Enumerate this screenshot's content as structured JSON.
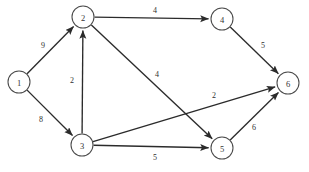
{
  "figure": {
    "type": "directed-weighted-graph",
    "background_color": "#ffffff",
    "node_stroke_color": "#4a4a4a",
    "edge_color": "#2b2b2b",
    "label_color": "#343434"
  },
  "nodes": [
    {
      "id": "1",
      "label": "1",
      "x": 19,
      "y": 82,
      "r": 11
    },
    {
      "id": "2",
      "label": "2",
      "x": 83,
      "y": 17,
      "r": 11
    },
    {
      "id": "3",
      "label": "3",
      "x": 82,
      "y": 145,
      "r": 11
    },
    {
      "id": "4",
      "label": "4",
      "x": 222,
      "y": 19,
      "r": 11
    },
    {
      "id": "5",
      "label": "5",
      "x": 222,
      "y": 148,
      "r": 11
    },
    {
      "id": "6",
      "label": "6",
      "x": 288,
      "y": 83,
      "r": 11
    }
  ],
  "edges": [
    {
      "from": "1",
      "to": "2",
      "weight": "9",
      "lx": 43,
      "ly": 45
    },
    {
      "from": "1",
      "to": "3",
      "weight": "8",
      "lx": 41,
      "ly": 119
    },
    {
      "from": "3",
      "to": "2",
      "weight": "2",
      "lx": 72,
      "ly": 80
    },
    {
      "from": "2",
      "to": "4",
      "weight": "4",
      "lx": 155,
      "ly": 10
    },
    {
      "from": "2",
      "to": "5",
      "weight": "4",
      "lx": 157,
      "ly": 74
    },
    {
      "from": "3",
      "to": "6",
      "weight": "2",
      "lx": 214,
      "ly": 95
    },
    {
      "from": "3",
      "to": "5",
      "weight": "5",
      "lx": 155,
      "ly": 157
    },
    {
      "from": "4",
      "to": "6",
      "weight": "5",
      "lx": 263,
      "ly": 45
    },
    {
      "from": "5",
      "to": "6",
      "weight": "6",
      "lx": 254,
      "ly": 127
    }
  ]
}
